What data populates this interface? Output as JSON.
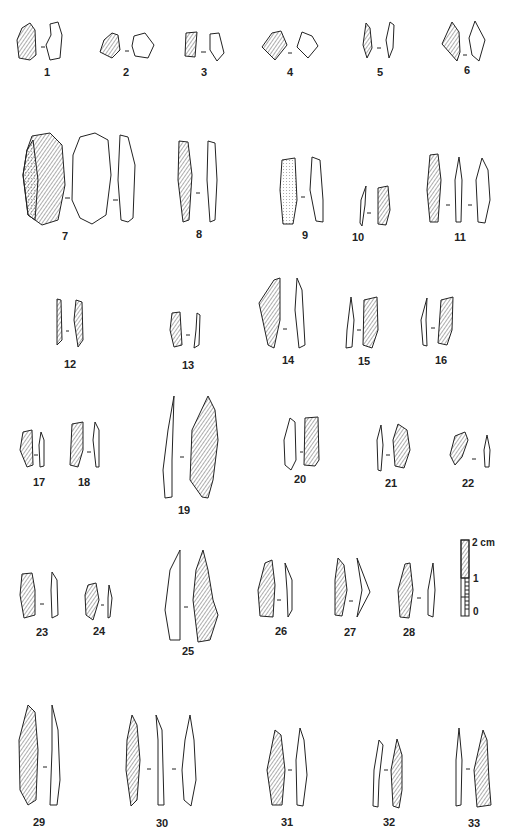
{
  "plate": {
    "figure_numbers": [
      {
        "n": "1",
        "x": 47,
        "y": 75
      },
      {
        "n": "2",
        "x": 126,
        "y": 75
      },
      {
        "n": "3",
        "x": 204,
        "y": 75
      },
      {
        "n": "4",
        "x": 290,
        "y": 75
      },
      {
        "n": "5",
        "x": 380,
        "y": 75
      },
      {
        "n": "6",
        "x": 467,
        "y": 73
      },
      {
        "n": "7",
        "x": 65,
        "y": 240
      },
      {
        "n": "8",
        "x": 199,
        "y": 236
      },
      {
        "n": "9",
        "x": 305,
        "y": 238
      },
      {
        "n": "10",
        "x": 358,
        "y": 239
      },
      {
        "n": "11",
        "x": 460,
        "y": 239
      },
      {
        "n": "12",
        "x": 70,
        "y": 366
      },
      {
        "n": "13",
        "x": 188,
        "y": 367
      },
      {
        "n": "14",
        "x": 288,
        "y": 362
      },
      {
        "n": "15",
        "x": 364,
        "y": 362
      },
      {
        "n": "16",
        "x": 441,
        "y": 361
      },
      {
        "n": "17",
        "x": 39,
        "y": 478
      },
      {
        "n": "18",
        "x": 84,
        "y": 478
      },
      {
        "n": "19",
        "x": 184,
        "y": 508
      },
      {
        "n": "20",
        "x": 300,
        "y": 476
      },
      {
        "n": "21",
        "x": 391,
        "y": 480
      },
      {
        "n": "22",
        "x": 468,
        "y": 480
      },
      {
        "n": "23",
        "x": 42,
        "y": 632
      },
      {
        "n": "24",
        "x": 99,
        "y": 630
      },
      {
        "n": "25",
        "x": 188,
        "y": 652
      },
      {
        "n": "26",
        "x": 281,
        "y": 629
      },
      {
        "n": "27",
        "x": 350,
        "y": 630
      },
      {
        "n": "28",
        "x": 409,
        "y": 630
      },
      {
        "n": "29",
        "x": 39,
        "y": 817
      },
      {
        "n": "30",
        "x": 162,
        "y": 820
      },
      {
        "n": "31",
        "x": 287,
        "y": 819
      },
      {
        "n": "32",
        "x": 389,
        "y": 819
      },
      {
        "n": "33",
        "x": 474,
        "y": 820
      }
    ]
  },
  "scale_bar": {
    "labels": [
      "2 cm",
      "1",
      "0"
    ],
    "unit": "cm"
  }
}
